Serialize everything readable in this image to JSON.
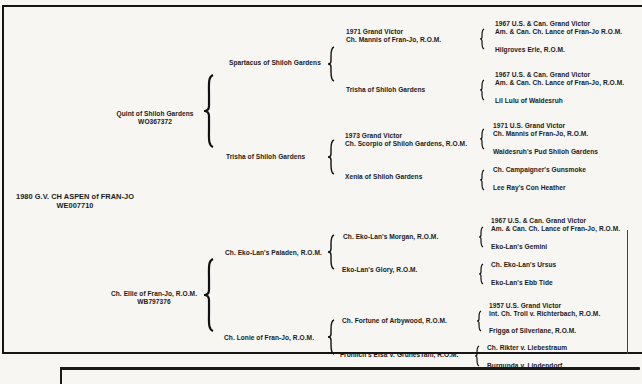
{
  "pedigree": {
    "subject": {
      "name": "1980 G.V. CH ASPEN of FRAN-JO",
      "reg": "WE007710"
    },
    "sire": {
      "name": "Quint of Shiloh Gardens",
      "reg": "WO367372",
      "sire": {
        "name": "Spartacus of Shiloh Gardens",
        "sire": {
          "title": "1971 Grand Victor",
          "name": "Ch. Mannis of Fran-Jo, R.O.M.",
          "sire": {
            "title": "1967 U.S. & Can. Grand Victor",
            "name": "Am. & Can. Ch. Lance of Fran-Jo R.O.M."
          },
          "dam": {
            "name": "Hilgroves Erle, R.O.M."
          }
        },
        "dam": {
          "name": "Waldesruh's Pud of Shiloh Gardens",
          "sire": {
            "title": "1967 U.S. & Can. Grand Victor",
            "name": "Am. & Can. Ch. Lance of Fran-Jo, R.O.M."
          },
          "dam": {
            "name": "Lil Lulu of Waldesruh"
          }
        }
      },
      "dam": {
        "name": "Trisha of Shiloh Gardens",
        "sire": {
          "title": "1973 Grand Victor",
          "name": "Ch. Scorpio of Shiloh Gardens, R.O.M.",
          "sire": {
            "title": "1971 U.S. Grand Victor",
            "name": "Ch. Mannis of Fran-Jo, R.O.M."
          },
          "dam": {
            "name": "Waldesruh's Pud Shiloh Gardens"
          }
        },
        "dam": {
          "name": "Xenia of Shiloh Gardens",
          "sire": {
            "name": "Ch. Campaigner's Gunsmoke"
          },
          "dam": {
            "name": "Lee Ray's Con Heather"
          }
        }
      }
    },
    "dam": {
      "name": "Ch. Ellie of Fran-Jo, R.O.M.",
      "reg": "WB797376",
      "sire": {
        "name": "Ch. Eko-Lan's Paladen, R.O.M.",
        "sire": {
          "name": "Ch. Eko-Lan's Morgan, R.O.M.",
          "sire": {
            "title": "1967 U.S. & Can. Grand Victor",
            "name": "Am. & Can. Ch. Lance of Fran-Jo, R.O.M."
          },
          "dam": {
            "name": "Eko-Lan's Gemini"
          }
        },
        "dam": {
          "name": "Eko-Lan's Glory, R.O.M.",
          "sire": {
            "name": "Ch. Eko-Lan's Ursus"
          },
          "dam": {
            "name": "Eko-Lan's Ebb Tide"
          }
        }
      },
      "dam": {
        "name": "Ch. Lonie of Fran-Jo, R.O.M.",
        "sire": {
          "name": "Ch. Fortune of Arbywood, R.O.M.",
          "sire": {
            "title": "1957 U.S. Grand Victor",
            "name": "Int. Ch. Troll v. Richterbach, R.O.M."
          },
          "dam": {
            "name": "Frigga of Silverlane, R.O.M."
          }
        },
        "dam": {
          "name": "Frohlich's Elsa V. GrunesTahl, R.O.M.",
          "sire": {
            "name": "Ch. Rikter v. Liebestraum"
          },
          "dam": {
            "name": "Burgunda v. Lindendorf"
          }
        }
      }
    }
  }
}
